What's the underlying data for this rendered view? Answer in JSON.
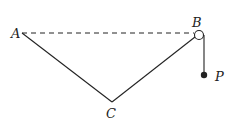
{
  "diagram": {
    "labels": {
      "A": "A",
      "B": "B",
      "C": "C",
      "P": "P"
    },
    "points": {
      "A": [
        22,
        33
      ],
      "B_pulley_center": [
        199,
        35
      ],
      "C": [
        112,
        102
      ],
      "P": [
        204,
        75
      ]
    },
    "pulley_radius": 4.5,
    "colors": {
      "stroke": "#222222",
      "background": "#ffffff"
    },
    "elements": [
      "dashed horizontal line AB",
      "string segment AC",
      "string segment CB",
      "pulley at B",
      "vertical string from pulley to P",
      "mass P"
    ]
  }
}
